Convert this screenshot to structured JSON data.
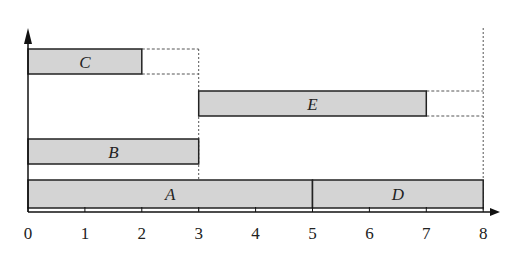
{
  "chart_data": {
    "type": "bar",
    "subtype": "gantt",
    "title": "",
    "xlabel": "",
    "ylabel": "",
    "xlim": [
      0,
      8
    ],
    "x_ticks": [
      "0",
      "1",
      "2",
      "3",
      "4",
      "5",
      "6",
      "7",
      "8"
    ],
    "grid": false,
    "legend": null,
    "bars": [
      {
        "label": "A",
        "start": 0,
        "end": 5,
        "row": 0
      },
      {
        "label": "D",
        "start": 5,
        "end": 8,
        "row": 0
      },
      {
        "label": "B",
        "start": 0,
        "end": 3,
        "row": 1
      },
      {
        "label": "E",
        "start": 3,
        "end": 7,
        "row": 2
      },
      {
        "label": "C",
        "start": 0,
        "end": 2,
        "row": 3
      }
    ],
    "dotted_slack": [
      {
        "label": "C",
        "from": 2,
        "to": 3
      },
      {
        "label": "E",
        "from": 7,
        "to": 8
      }
    ],
    "dotted_verticals": [
      3,
      8
    ]
  },
  "colors": {
    "bar_fill": "#d4d4d4",
    "stroke": "#222222"
  }
}
